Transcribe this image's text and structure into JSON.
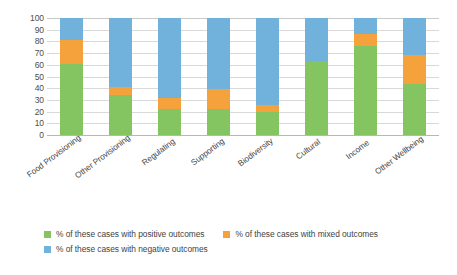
{
  "chart_data": {
    "type": "bar",
    "subtype": "stacked-bar-100-percent",
    "title": "",
    "subtitle": "",
    "xlabel": "",
    "ylabel": "",
    "ylim": [
      0,
      100
    ],
    "ytick_values": [
      0,
      10,
      20,
      30,
      40,
      50,
      60,
      70,
      80,
      90,
      100
    ],
    "ytick_labels": [
      "0",
      "10",
      "20",
      "30",
      "40",
      "50",
      "60",
      "70",
      "80",
      "90",
      "100"
    ],
    "grid": true,
    "grid_axis": "y",
    "legend_position": "bottom-left",
    "categories": [
      "Food Provisioning",
      "Other Provisioning",
      "Regulating",
      "Supporting",
      "Biodiversity",
      "Cultural",
      "Income",
      "Other Wellbeing"
    ],
    "series": [
      {
        "name": "% of these cases with positive outcomes",
        "color": "#84C561",
        "values": [
          61,
          34,
          22,
          22,
          20,
          63,
          76,
          44
        ]
      },
      {
        "name": "% of these cases with mixed outcomes",
        "color": "#F5A13C",
        "values": [
          20,
          7,
          10,
          17,
          6,
          0,
          10,
          24
        ]
      },
      {
        "name": "% of these cases with negative outcomes",
        "color": "#71B2DD",
        "values": [
          19,
          59,
          68,
          61,
          74,
          37,
          14,
          32
        ]
      }
    ]
  },
  "axis": {
    "y_ticks": [
      "100",
      "90",
      "80",
      "70",
      "60",
      "50",
      "40",
      "30",
      "20",
      "10",
      "0"
    ],
    "x_ticks": [
      "Food Provisioning",
      "Other Provisioning",
      "Regulating",
      "Supporting",
      "Biodiversity",
      "Cultural",
      "Income",
      "Other Wellbeing"
    ]
  },
  "legend": {
    "items": [
      {
        "label": "% of these cases with positive outcomes",
        "color": "#84C561"
      },
      {
        "label": "% of these cases with mixed outcomes",
        "color": "#F5A13C"
      },
      {
        "label": "% of these cases with negative outcomes",
        "color": "#71B2DD"
      }
    ]
  },
  "colors": {
    "positive": "#84C561",
    "mixed": "#F5A13C",
    "negative": "#71B2DD",
    "gridline": "#d9d9d9",
    "axis_text": "#4d4d4d",
    "background": "#ffffff"
  }
}
